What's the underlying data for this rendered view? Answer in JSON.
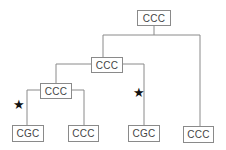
{
  "tree": {
    "root": {
      "label": "CCC"
    },
    "level1": {
      "label": "CCC"
    },
    "level2": {
      "label": "CCC"
    },
    "leaves": [
      {
        "label": "CGC",
        "starred": true
      },
      {
        "label": "CCC",
        "starred": false
      },
      {
        "label": "CGC",
        "starred": true
      },
      {
        "label": "CCC",
        "starred": false
      }
    ],
    "star_glyph": "★"
  }
}
